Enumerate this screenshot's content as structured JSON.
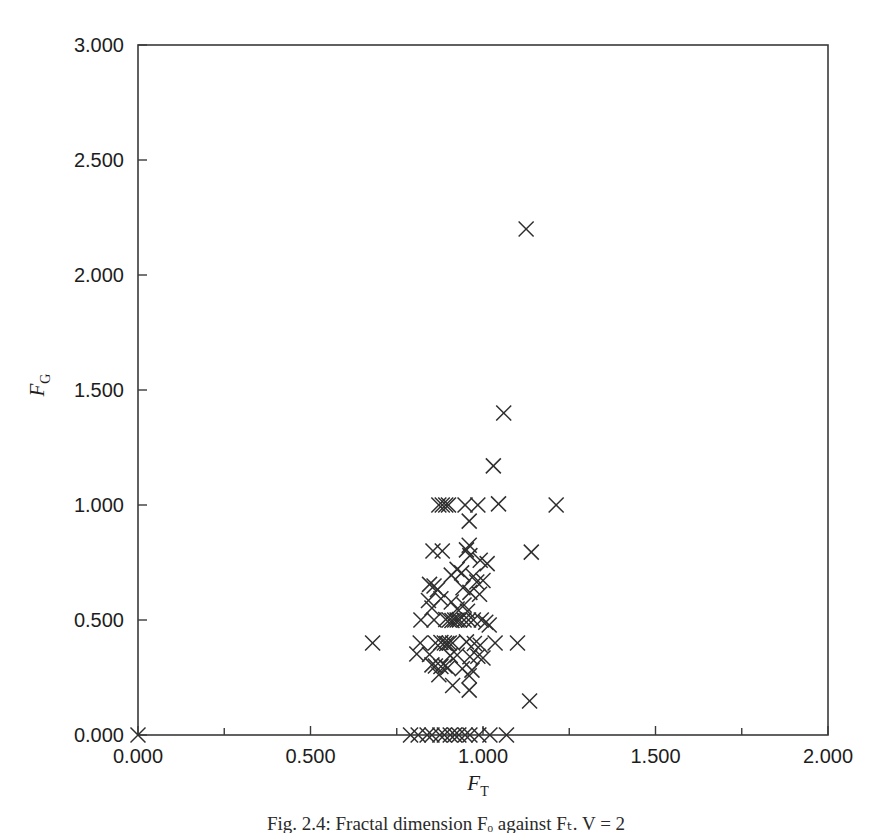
{
  "figure": {
    "caption": "Fig. 2.4: Fractal dimension Fₒ against Fₜ. V = 2"
  },
  "chart_data": {
    "type": "scatter",
    "title": "",
    "xlabel": "F_T",
    "ylabel": "F_G",
    "xlabel_base": "F",
    "xlabel_sub": "T",
    "ylabel_base": "F",
    "ylabel_sub": "G",
    "xlim": [
      0.0,
      2.0
    ],
    "ylim": [
      0.0,
      3.0
    ],
    "grid": false,
    "legend": null,
    "marker": "x",
    "marker_color": "#2e2e2e",
    "xticks": [
      0.0,
      0.5,
      1.0,
      1.5,
      2.0
    ],
    "xtick_labels": [
      "0.000",
      "0.500",
      "1.000",
      "1.500",
      "2.000"
    ],
    "xminor_ticks": [
      0.25,
      0.75,
      1.25,
      1.75
    ],
    "yticks": [
      0.0,
      0.5,
      1.0,
      1.5,
      2.0,
      2.5,
      3.0
    ],
    "ytick_labels": [
      "0.000",
      "0.500",
      "1.000",
      "1.500",
      "2.000",
      "2.500",
      "3.000"
    ],
    "points": [
      [
        0.0,
        0.0
      ],
      [
        0.79,
        0.0
      ],
      [
        0.812,
        0.0
      ],
      [
        0.838,
        0.0
      ],
      [
        0.852,
        0.0
      ],
      [
        0.875,
        0.0
      ],
      [
        0.888,
        0.0
      ],
      [
        0.905,
        0.0
      ],
      [
        0.918,
        0.0
      ],
      [
        0.93,
        0.0
      ],
      [
        0.948,
        0.0
      ],
      [
        0.962,
        0.0
      ],
      [
        0.988,
        0.0
      ],
      [
        1.02,
        0.0
      ],
      [
        1.068,
        0.0
      ],
      [
        1.125,
        2.2
      ],
      [
        1.06,
        1.4
      ],
      [
        1.03,
        1.17
      ],
      [
        0.872,
        1.0
      ],
      [
        0.882,
        1.0
      ],
      [
        0.892,
        1.0
      ],
      [
        0.9,
        1.0
      ],
      [
        0.948,
        1.0
      ],
      [
        0.985,
        1.0
      ],
      [
        1.045,
        1.005
      ],
      [
        1.212,
        1.0
      ],
      [
        0.96,
        0.93
      ],
      [
        0.855,
        0.8
      ],
      [
        0.882,
        0.8
      ],
      [
        0.952,
        0.805
      ],
      [
        0.96,
        0.825
      ],
      [
        0.962,
        0.78
      ],
      [
        0.992,
        0.76
      ],
      [
        1.012,
        0.745
      ],
      [
        1.14,
        0.795
      ],
      [
        0.925,
        0.72
      ],
      [
        0.938,
        0.705
      ],
      [
        0.908,
        0.695
      ],
      [
        0.972,
        0.69
      ],
      [
        0.982,
        0.665
      ],
      [
        1.0,
        0.672
      ],
      [
        0.845,
        0.655
      ],
      [
        0.858,
        0.648
      ],
      [
        0.868,
        0.632
      ],
      [
        0.942,
        0.64
      ],
      [
        0.962,
        0.62
      ],
      [
        0.99,
        0.612
      ],
      [
        0.842,
        0.585
      ],
      [
        0.878,
        0.592
      ],
      [
        0.908,
        0.578
      ],
      [
        0.945,
        0.565
      ],
      [
        0.852,
        0.552
      ],
      [
        0.925,
        0.548
      ],
      [
        0.955,
        0.538
      ],
      [
        0.82,
        0.5
      ],
      [
        0.858,
        0.5
      ],
      [
        0.892,
        0.502
      ],
      [
        0.902,
        0.5
      ],
      [
        0.91,
        0.498
      ],
      [
        0.918,
        0.5
      ],
      [
        0.925,
        0.5
      ],
      [
        0.932,
        0.5
      ],
      [
        0.945,
        0.5
      ],
      [
        0.958,
        0.5
      ],
      [
        0.972,
        0.5
      ],
      [
        0.995,
        0.5
      ],
      [
        1.008,
        0.49
      ],
      [
        1.018,
        0.478
      ],
      [
        0.68,
        0.4
      ],
      [
        0.818,
        0.4
      ],
      [
        0.862,
        0.4
      ],
      [
        0.878,
        0.402
      ],
      [
        0.888,
        0.4
      ],
      [
        0.895,
        0.398
      ],
      [
        0.902,
        0.4
      ],
      [
        0.912,
        0.4
      ],
      [
        0.952,
        0.405
      ],
      [
        0.975,
        0.398
      ],
      [
        0.992,
        0.39
      ],
      [
        1.035,
        0.4
      ],
      [
        1.1,
        0.4
      ],
      [
        0.808,
        0.352
      ],
      [
        0.845,
        0.35
      ],
      [
        0.905,
        0.345
      ],
      [
        0.925,
        0.348
      ],
      [
        0.962,
        0.34
      ],
      [
        0.985,
        0.342
      ],
      [
        1.0,
        0.335
      ],
      [
        0.852,
        0.305
      ],
      [
        0.862,
        0.3
      ],
      [
        0.878,
        0.298
      ],
      [
        0.89,
        0.3
      ],
      [
        0.898,
        0.292
      ],
      [
        0.94,
        0.288
      ],
      [
        0.968,
        0.282
      ],
      [
        0.872,
        0.262
      ],
      [
        0.96,
        0.258
      ],
      [
        0.912,
        0.215
      ],
      [
        0.96,
        0.195
      ],
      [
        1.135,
        0.148
      ]
    ],
    "n_points": 102
  }
}
